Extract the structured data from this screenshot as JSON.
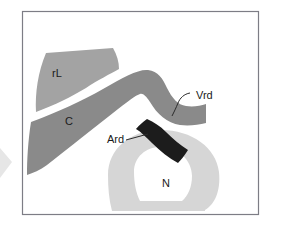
{
  "figure": {
    "background_color": "#ffffff",
    "frame": {
      "stroke_color": "#7d7d85",
      "x": 22,
      "y": 11,
      "width": 237,
      "height": 204
    },
    "edge_marker": {
      "name": "left-edge-chevron",
      "color": "#e3e3e3"
    }
  },
  "regions": [
    {
      "id": "rL",
      "label": "rL",
      "color": "#a3a3a3",
      "label_x": 57,
      "label_y": 74
    },
    {
      "id": "C",
      "label": "C",
      "color": "#8a8a8a",
      "label_x": 69,
      "label_y": 122
    },
    {
      "id": "Vrd",
      "label": "Vrd",
      "color": "#8a8a8a",
      "label_x": 196,
      "label_y": 96
    },
    {
      "id": "Ard",
      "label": "Ard",
      "color": "#1c1c1c",
      "label_x": 110,
      "label_y": 140
    },
    {
      "id": "N",
      "label": "N",
      "color": "#d6d6d6",
      "label_x": 166,
      "label_y": 184
    }
  ],
  "leaders": [
    {
      "id": "vrd-leader",
      "from_label": "Vrd",
      "to_region": "Vrd"
    },
    {
      "id": "ard-leader",
      "from_label": "Ard",
      "to_region": "Ard"
    }
  ]
}
